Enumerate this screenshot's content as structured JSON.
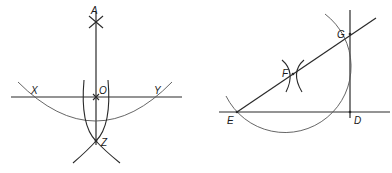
{
  "figure_left": {
    "description": "Perpendicular bisector construction through point O on line XY",
    "labels": {
      "A": "A",
      "X": "X",
      "O": "O",
      "Y": "Y",
      "Z": "Z"
    }
  },
  "figure_right": {
    "description": "Perpendicular at endpoint D constructed with circle centered on F through D, E and G",
    "labels": {
      "E": "E",
      "F": "F",
      "G": "G",
      "D": "D"
    }
  },
  "colors": {
    "line": "#2a2a2a",
    "arc": "#555555",
    "background": "#ffffff"
  }
}
